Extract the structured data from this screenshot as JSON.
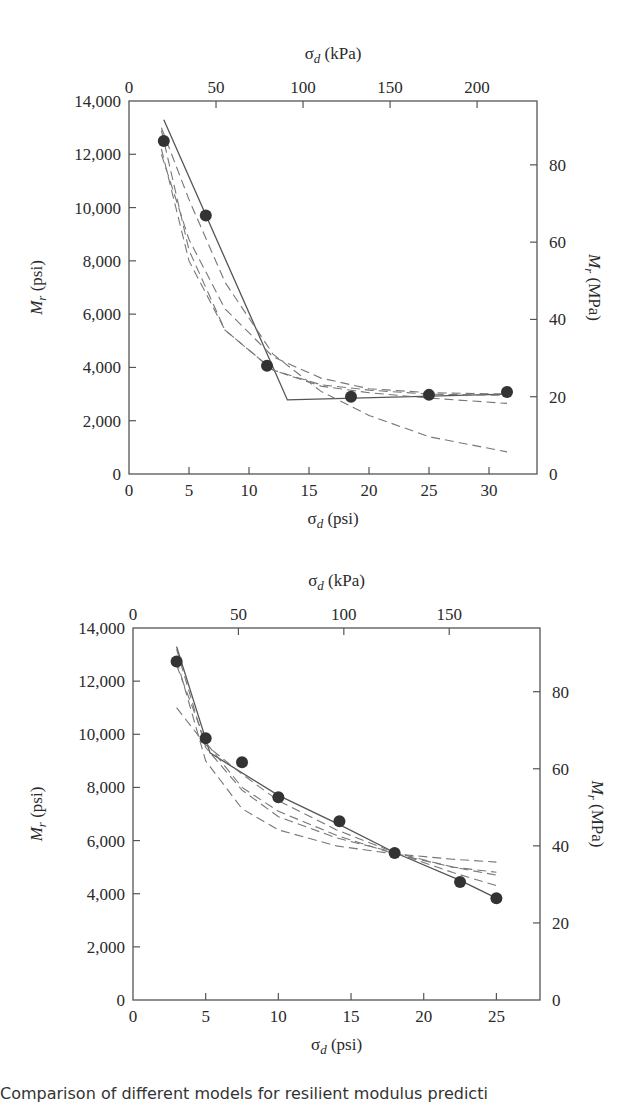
{
  "caption": "Comparison of different models for resilient modulus predicti",
  "chart_data": [
    {
      "type": "scatter",
      "title": "",
      "xlabel": "σd (psi)",
      "x2label": "σd (kPa)",
      "ylabel": "Mr (psi)",
      "y2label": "Mr (MPa)",
      "xlim": [
        0,
        34
      ],
      "ylim": [
        0,
        14000
      ],
      "x_ticks": [
        0,
        5,
        10,
        15,
        20,
        25,
        30
      ],
      "y_ticks": [
        0,
        2000,
        4000,
        6000,
        8000,
        10000,
        12000,
        14000
      ],
      "y_tick_labels": [
        "0",
        "2,000",
        "4,000",
        "6,000",
        "8,000",
        "10,000",
        "12,000",
        "14,000"
      ],
      "x2_ticks": [
        0,
        50,
        100,
        150,
        200
      ],
      "y2_ticks": [
        0,
        20,
        40,
        60,
        80
      ],
      "grid": false,
      "frame": {
        "left": 129,
        "right": 537,
        "top": 101,
        "bottom": 474
      },
      "points": {
        "x": [
          2.9,
          6.4,
          11.5,
          18.5,
          25.0,
          31.5
        ],
        "y": [
          12500,
          9700,
          4060,
          2900,
          2970,
          3080
        ]
      },
      "series": [
        {
          "name": "bilinear model",
          "style": "solid",
          "x": [
            2.9,
            13.2,
            31.5
          ],
          "y": [
            13300,
            2780,
            3000
          ]
        },
        {
          "name": "model A",
          "style": "dashed",
          "x": [
            2.7,
            5,
            8,
            12,
            16,
            20,
            25,
            31.5
          ],
          "y": [
            12900,
            8400,
            5400,
            3900,
            3300,
            3050,
            2850,
            2650
          ]
        },
        {
          "name": "model B",
          "style": "dashed",
          "x": [
            2.7,
            5,
            8,
            12,
            16,
            20,
            25,
            31.5
          ],
          "y": [
            12000,
            8800,
            6200,
            4400,
            3600,
            3200,
            3050,
            3000
          ]
        },
        {
          "name": "model C",
          "style": "dashed",
          "x": [
            2.7,
            5,
            8,
            12,
            16,
            20,
            25,
            31.5
          ],
          "y": [
            13000,
            10300,
            7200,
            4500,
            3100,
            2200,
            1400,
            830
          ]
        },
        {
          "name": "model D",
          "style": "dashed",
          "x": [
            2.7,
            5,
            8,
            12,
            16,
            20,
            25,
            31.5
          ],
          "y": [
            12200,
            8000,
            5400,
            3900,
            3350,
            3150,
            3000,
            2950
          ]
        }
      ]
    },
    {
      "type": "scatter",
      "title": "",
      "xlabel": "σd (psi)",
      "x2label": "σd (kPa)",
      "ylabel": "Mr (psi)",
      "y2label": "Mr (MPa)",
      "xlim": [
        0,
        28
      ],
      "ylim": [
        0,
        14000
      ],
      "x_ticks": [
        0,
        5,
        10,
        15,
        20,
        25
      ],
      "y_ticks": [
        0,
        2000,
        4000,
        6000,
        8000,
        10000,
        12000,
        14000
      ],
      "y_tick_labels": [
        "0",
        "2,000",
        "4,000",
        "6,000",
        "8,000",
        "10,000",
        "12,000",
        "14,000"
      ],
      "x2_ticks": [
        0,
        50,
        100,
        150
      ],
      "y2_ticks": [
        0,
        20,
        40,
        60,
        80
      ],
      "grid": false,
      "frame": {
        "left": 133,
        "right": 540,
        "top": 628,
        "bottom": 1000
      },
      "points": {
        "x": [
          3.0,
          5.0,
          7.5,
          10.0,
          14.2,
          18.0,
          22.5,
          25.0
        ],
        "y": [
          12740,
          9850,
          8950,
          7630,
          6730,
          5530,
          4440,
          3830
        ]
      },
      "series": [
        {
          "name": "bilinear model",
          "style": "solid",
          "x": [
            3.0,
            5.3,
            10,
            14.2,
            18,
            22.5,
            25
          ],
          "y": [
            13300,
            9300,
            7700,
            6600,
            5550,
            4500,
            3830
          ]
        },
        {
          "name": "model A",
          "style": "dashed",
          "x": [
            3.0,
            5,
            7.5,
            10,
            14,
            18,
            22,
            25
          ],
          "y": [
            13200,
            9500,
            7900,
            6900,
            6100,
            5550,
            5000,
            4700
          ]
        },
        {
          "name": "model B",
          "style": "dashed",
          "x": [
            3.0,
            5,
            7.5,
            10,
            14,
            18,
            22,
            25
          ],
          "y": [
            11000,
            9600,
            8500,
            7500,
            6400,
            5550,
            4800,
            4300
          ]
        },
        {
          "name": "model C",
          "style": "dashed",
          "x": [
            3.0,
            5,
            7.5,
            10,
            14,
            18,
            22,
            25
          ],
          "y": [
            12800,
            9000,
            7200,
            6400,
            5800,
            5500,
            5300,
            5190
          ]
        },
        {
          "name": "model D",
          "style": "dashed",
          "x": [
            3.0,
            5,
            7.5,
            10,
            14,
            18,
            22,
            25
          ],
          "y": [
            12600,
            9700,
            8000,
            7100,
            6200,
            5500,
            5000,
            4810
          ]
        }
      ]
    }
  ]
}
